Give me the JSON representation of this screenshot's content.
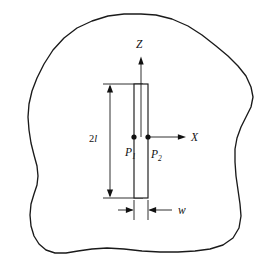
{
  "figure": {
    "kind": "engineering-diagram",
    "background_color": "#ffffff",
    "line_color": "#1a1a1a"
  },
  "axes": {
    "vertical": {
      "label": "Z",
      "direction": "up",
      "origin_x": 141,
      "tip_y": 57,
      "tail_y": 137
    },
    "horizontal": {
      "label": "X",
      "direction": "right",
      "origin_y": 137,
      "tail_x": 150,
      "tip_x": 186
    }
  },
  "slot": {
    "name": "slot",
    "x_left": 134,
    "x_right": 148,
    "y_top": 84,
    "y_bottom": 198,
    "width_label": "w",
    "length_label": "2l"
  },
  "points": [
    {
      "id": "P1",
      "label": "P",
      "subscript": "1",
      "cx": 134,
      "cy": 137
    },
    {
      "id": "P2",
      "label": "P",
      "subscript": "2",
      "cx": 148,
      "cy": 137
    }
  ],
  "dimensions": [
    {
      "name": "length",
      "label": "2l",
      "label_text": "2",
      "label_italic": "l",
      "orientation": "vertical",
      "line_x": 110,
      "from_y": 84,
      "to_y": 198,
      "extension_from_x": 103,
      "extension_to_x": 143,
      "label_x": 95,
      "label_y": 142
    },
    {
      "name": "width",
      "label": "w",
      "orientation": "horizontal",
      "line_y": 210,
      "left_x": 134,
      "right_x": 148,
      "label_x": 183,
      "label_y": 214
    }
  ],
  "body_outline": {
    "name": "body-boundary",
    "closed": true,
    "points": [
      [
        141,
        14
      ],
      [
        156,
        15
      ],
      [
        172,
        19
      ],
      [
        188,
        26
      ],
      [
        202,
        35
      ],
      [
        216,
        46
      ],
      [
        228,
        56
      ],
      [
        238,
        66
      ],
      [
        246,
        76
      ],
      [
        251,
        87
      ],
      [
        253,
        97
      ],
      [
        251,
        107
      ],
      [
        246,
        117
      ],
      [
        241,
        127
      ],
      [
        237,
        138
      ],
      [
        235,
        149
      ],
      [
        235,
        162
      ],
      [
        236,
        176
      ],
      [
        238,
        190
      ],
      [
        240,
        204
      ],
      [
        241,
        216
      ],
      [
        239,
        228
      ],
      [
        233,
        238
      ],
      [
        223,
        245
      ],
      [
        210,
        249
      ],
      [
        195,
        251
      ],
      [
        178,
        252
      ],
      [
        160,
        252
      ],
      [
        142,
        251
      ],
      [
        124,
        249
      ],
      [
        107,
        248
      ],
      [
        92,
        249
      ],
      [
        78,
        251
      ],
      [
        66,
        253
      ],
      [
        55,
        253
      ],
      [
        46,
        250
      ],
      [
        39,
        244
      ],
      [
        34,
        236
      ],
      [
        31,
        226
      ],
      [
        30,
        215
      ],
      [
        31,
        204
      ],
      [
        34,
        194
      ],
      [
        37,
        185
      ],
      [
        38,
        176
      ],
      [
        37,
        166
      ],
      [
        34,
        155
      ],
      [
        31,
        143
      ],
      [
        29,
        130
      ],
      [
        28,
        117
      ],
      [
        29,
        104
      ],
      [
        32,
        91
      ],
      [
        37,
        78
      ],
      [
        44,
        64
      ],
      [
        53,
        50
      ],
      [
        64,
        38
      ],
      [
        77,
        28
      ],
      [
        92,
        21
      ],
      [
        108,
        16
      ],
      [
        124,
        14
      ]
    ]
  },
  "labels": {
    "z_axis": "Z",
    "x_axis": "X",
    "point_1_base": "P",
    "point_1_sub": "1",
    "point_2_base": "P",
    "point_2_sub": "2",
    "length_prefix": "2",
    "length_symbol": "l",
    "width_symbol": "w"
  }
}
